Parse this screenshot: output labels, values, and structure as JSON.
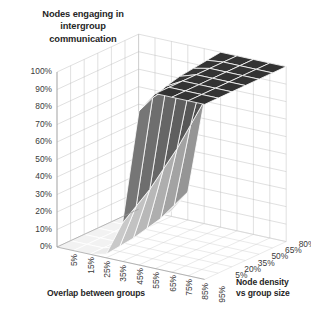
{
  "chart_data": {
    "type": "surface",
    "title": "Nodes engaging in intergroup communication",
    "title_lines": [
      "Nodes engaging in",
      "intergroup",
      "communication"
    ],
    "xlabel": "Overlap between groups",
    "zlabel": "Node density vs group size",
    "zlabel_lines": [
      "Node density",
      "vs group size"
    ],
    "ylabel": "",
    "x_categories": [
      "5%",
      "15%",
      "25%",
      "35%",
      "45%",
      "55%",
      "65%",
      "75%",
      "85%",
      "95%"
    ],
    "z_categories": [
      "5%",
      "20%",
      "35%",
      "50%",
      "65%",
      "80%",
      "95%"
    ],
    "y_ticks": [
      "0%",
      "10%",
      "20%",
      "30%",
      "40%",
      "50%",
      "60%",
      "70%",
      "80%",
      "90%",
      "100%"
    ],
    "ylim": [
      0,
      100
    ],
    "grid": true,
    "legend": "none",
    "colormap": "grayscale",
    "surface_low_color": "#f2f2f2",
    "surface_high_color": "#333333",
    "gridline_color": "#ffffff",
    "wall_color": "#b9b9b9",
    "series": [
      {
        "name": "5%",
        "values": [
          0,
          0,
          0,
          2,
          22,
          88,
          100,
          100,
          100,
          100
        ]
      },
      {
        "name": "20%",
        "values": [
          0,
          0,
          0,
          3,
          28,
          92,
          100,
          100,
          100,
          100
        ]
      },
      {
        "name": "35%",
        "values": [
          0,
          0,
          0,
          4,
          34,
          95,
          100,
          100,
          100,
          100
        ]
      },
      {
        "name": "50%",
        "values": [
          0,
          0,
          1,
          6,
          42,
          97,
          100,
          100,
          100,
          100
        ]
      },
      {
        "name": "65%",
        "values": [
          0,
          0,
          1,
          8,
          50,
          98,
          100,
          100,
          100,
          100
        ]
      },
      {
        "name": "80%",
        "values": [
          0,
          0,
          2,
          12,
          60,
          99,
          100,
          100,
          100,
          100
        ]
      },
      {
        "name": "95%",
        "values": [
          0,
          0,
          3,
          16,
          70,
          100,
          100,
          100,
          100,
          100
        ]
      }
    ]
  }
}
